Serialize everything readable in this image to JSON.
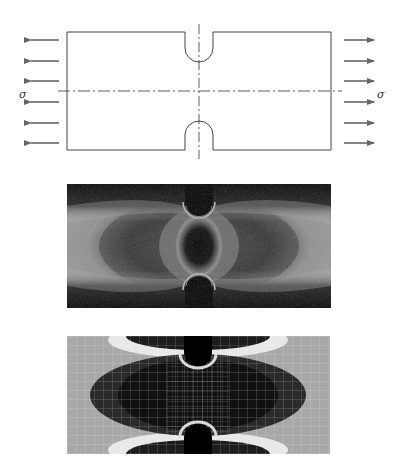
{
  "figure": {
    "panels": [
      {
        "id": "schematic",
        "description": "Double-edge notched plate under uniaxial tension"
      },
      {
        "id": "photoelastic",
        "description": "Photoelastic fringe pattern of notched plate"
      },
      {
        "id": "fem",
        "description": "Finite element stress contour with mesh"
      }
    ],
    "schematic": {
      "load_label_left": "σ",
      "load_label_right": "σ",
      "arrow_count_per_side": 6,
      "colors": {
        "outline": "#333333",
        "arrow": "#666666",
        "centerline": "#333333"
      }
    },
    "colors": {
      "background": "#ffffff",
      "fringe_dark": "#0a0a0a",
      "fringe_light": "#9a9a9a",
      "fem_light": "#a8a8a8",
      "fem_dark": "#1a1a1a",
      "fem_white": "#e8e8e8"
    }
  }
}
